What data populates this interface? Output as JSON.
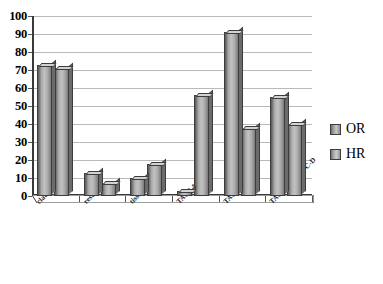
{
  "chart_data": {
    "type": "bar",
    "title": "",
    "xlabel": "",
    "ylabel": "",
    "ylim": [
      0,
      100
    ],
    "ytick_step": 10,
    "grid": true,
    "legend_position": "right",
    "categories": [
      "claudication",
      "rest pain",
      "tissue loss",
      "TASC A-B",
      "TASC C-D",
      "TASC fem-pop C-D"
    ],
    "series": [
      {
        "name": "OR",
        "values": [
          73,
          13,
          10,
          3,
          91,
          55
        ],
        "color": "#b0b0b0"
      },
      {
        "name": "HR",
        "values": [
          71,
          7,
          18,
          56,
          38,
          40
        ],
        "color": "#b8b8b8"
      }
    ],
    "yticks": [
      "0",
      "10",
      "20",
      "30",
      "40",
      "50",
      "60",
      "70",
      "80",
      "90",
      "100"
    ]
  },
  "legend": {
    "items": [
      {
        "label": "OR"
      },
      {
        "label": "HR"
      }
    ]
  }
}
